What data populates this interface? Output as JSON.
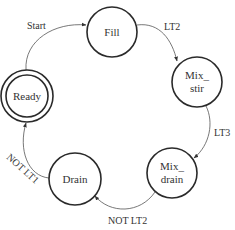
{
  "diagram": {
    "type": "state-machine",
    "colors": {
      "stroke": "#2a2a2a",
      "edge": "#555555",
      "text": "#333333",
      "background": "#ffffff"
    },
    "states": [
      {
        "id": "ready",
        "label": "Ready",
        "initial": true,
        "double_circle": true
      },
      {
        "id": "fill",
        "label": "Fill"
      },
      {
        "id": "mix_stir",
        "label_line1": "Mix_",
        "label_line2": "stir"
      },
      {
        "id": "mix_drain",
        "label_line1": "Mix_",
        "label_line2": "drain"
      },
      {
        "id": "drain",
        "label": "Drain"
      }
    ],
    "transitions": [
      {
        "from": "ready",
        "to": "fill",
        "label": "Start"
      },
      {
        "from": "fill",
        "to": "mix_stir",
        "label": "LT2"
      },
      {
        "from": "mix_stir",
        "to": "mix_drain",
        "label": "LT3"
      },
      {
        "from": "mix_drain",
        "to": "drain",
        "label": "NOT LT2"
      },
      {
        "from": "drain",
        "to": "ready",
        "label": "NOT LT1"
      }
    ]
  }
}
